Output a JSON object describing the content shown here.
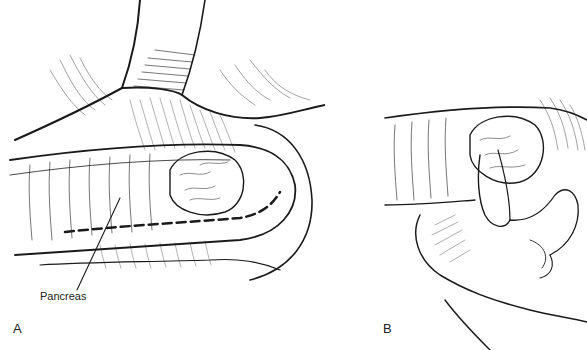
{
  "figure": {
    "panels": [
      {
        "id": "A",
        "panel_label": "A",
        "annotations": [
          {
            "text": "Pancreas"
          }
        ]
      },
      {
        "id": "B",
        "panel_label": "B",
        "annotations": []
      }
    ],
    "colors": {
      "ink": "#1a1a1a",
      "background": "#ffffff"
    }
  }
}
